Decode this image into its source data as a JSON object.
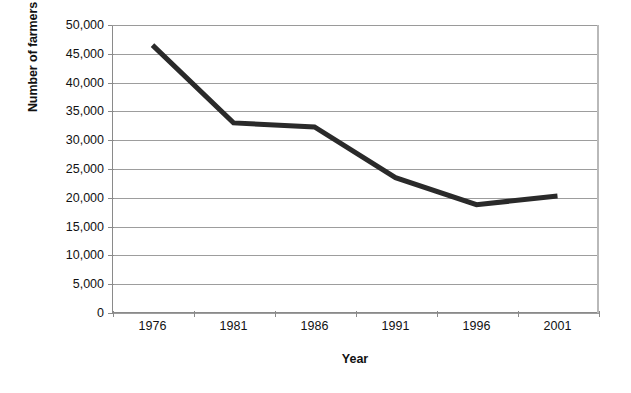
{
  "chart_data": {
    "type": "line",
    "title": "",
    "xlabel": "Year",
    "ylabel": "Number of farmers",
    "categories": [
      "1976",
      "1981",
      "1986",
      "1991",
      "1996",
      "2001"
    ],
    "series": [
      {
        "name": "Number of farmers",
        "values": [
          46500,
          33000,
          32300,
          23500,
          18800,
          20300
        ],
        "color": "#2a2a2a",
        "line_width": 5
      }
    ],
    "ylim": [
      0,
      50000
    ],
    "ytick_labels": [
      "50,000",
      "45,000",
      "40,000",
      "35,000",
      "30,000",
      "25,000",
      "20,000",
      "15,000",
      "10,000",
      "5,000",
      "0"
    ],
    "ytick_values": [
      50000,
      45000,
      40000,
      35000,
      30000,
      25000,
      20000,
      15000,
      10000,
      5000,
      0
    ],
    "grid": true,
    "grid_axis": "y",
    "grid_color": "#9d9d9d",
    "legend": false,
    "legend_position": "none",
    "axis_color": "#8a8a8a",
    "background_color": "#ffffff",
    "text_color": "#111111"
  }
}
